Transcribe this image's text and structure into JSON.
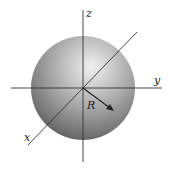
{
  "diagram": {
    "title": "",
    "labels": {
      "z": "z",
      "y": "y",
      "x": "x",
      "radius": "R"
    },
    "shape": "sphere",
    "colors": {
      "sphere_light": "#e8e8e8",
      "sphere_mid": "#a8a8a8",
      "sphere_dark": "#4a4a4a",
      "axis": "#333333"
    }
  }
}
